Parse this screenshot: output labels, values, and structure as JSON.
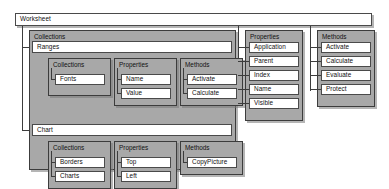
{
  "diagram": {
    "title": "Worksheet",
    "root": {
      "label": "Worksheet"
    },
    "groups": [
      {
        "id": "collections-group",
        "label": "Collections",
        "children": [
          {
            "id": "ranges",
            "label": "Ranges",
            "sections": [
              {
                "id": "ranges-collections",
                "label": "Collections",
                "items": [
                  "Fonts"
                ]
              },
              {
                "id": "ranges-properties",
                "label": "Properties",
                "items": [
                  "Name",
                  "Value"
                ]
              },
              {
                "id": "ranges-methods",
                "label": "Methods",
                "items": [
                  "Activate",
                  "Calculate"
                ]
              }
            ]
          },
          {
            "id": "chart",
            "label": "Chart",
            "sections": [
              {
                "id": "chart-collections",
                "label": "Collections",
                "items": [
                  "Borders",
                  "Charts"
                ]
              },
              {
                "id": "chart-properties",
                "label": "Properties",
                "items": [
                  "Top",
                  "Left"
                ]
              },
              {
                "id": "chart-methods",
                "label": "Methods",
                "items": [
                  "CopyPicture"
                ]
              }
            ]
          }
        ]
      },
      {
        "id": "worksheet-properties",
        "label": "Properties",
        "items": [
          "Application",
          "Parent",
          "Index",
          "Name",
          "Visible"
        ]
      },
      {
        "id": "worksheet-methods",
        "label": "Methods",
        "items": [
          "Activate",
          "Calculate",
          "Evaluate",
          "Protect"
        ]
      }
    ]
  },
  "colors": {
    "panel_fill": "#a8a8a8",
    "node_fill": "#ffffff",
    "line": "#3c3c3c",
    "text": "#111111"
  }
}
